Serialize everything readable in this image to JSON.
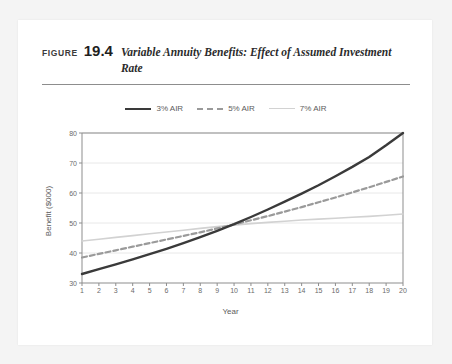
{
  "figure": {
    "label": "FIGURE",
    "number": "19.4",
    "title": "Variable Annuity Benefits: Effect of Assumed Investment Rate"
  },
  "colors": {
    "series_3": "#3a3a3a",
    "series_5": "#9a9a9a",
    "series_7": "#d2d2d2",
    "grid": "#e8e8e8",
    "axis": "#8d8d8d",
    "text": "#5c5c5c",
    "card": "#ffffff",
    "page": "#f4f4f4"
  },
  "legend": {
    "position": "top-center",
    "items": [
      {
        "label": "3% AIR",
        "style": "solid",
        "color": "#3a3a3a"
      },
      {
        "label": "5% AIR",
        "style": "dashed",
        "color": "#9a9a9a"
      },
      {
        "label": "7% AIR",
        "style": "solid",
        "color": "#d2d2d2"
      }
    ]
  },
  "chart_data": {
    "type": "line",
    "title": "Variable Annuity Benefits: Effect of Assumed Investment Rate",
    "xlabel": "Year",
    "ylabel": "Benefit ($000)",
    "xlim": [
      1,
      20
    ],
    "ylim": [
      30,
      80
    ],
    "yticks": [
      30,
      40,
      50,
      60,
      70,
      80
    ],
    "xticks": [
      1,
      2,
      3,
      4,
      5,
      6,
      7,
      8,
      9,
      10,
      11,
      12,
      13,
      14,
      15,
      16,
      17,
      18,
      19,
      20
    ],
    "grid": true,
    "x": [
      1,
      2,
      3,
      4,
      5,
      6,
      7,
      8,
      9,
      10,
      11,
      12,
      13,
      14,
      15,
      16,
      17,
      18,
      19,
      20
    ],
    "series": [
      {
        "name": "3% AIR",
        "style": "solid",
        "color": "#3a3a3a",
        "values": [
          33.0,
          34.6,
          36.2,
          37.9,
          39.6,
          41.4,
          43.3,
          45.3,
          47.4,
          49.6,
          52.0,
          54.5,
          57.1,
          59.8,
          62.6,
          65.6,
          68.7,
          72.0,
          75.9,
          80.0
        ]
      },
      {
        "name": "5% AIR",
        "style": "dashed",
        "color": "#9a9a9a",
        "values": [
          38.5,
          39.7,
          40.9,
          42.1,
          43.3,
          44.5,
          45.7,
          46.9,
          48.2,
          49.5,
          50.9,
          52.3,
          53.8,
          55.3,
          56.9,
          58.5,
          60.2,
          61.9,
          63.7,
          65.5
        ]
      },
      {
        "name": "7% AIR",
        "style": "solid",
        "color": "#d2d2d2",
        "values": [
          44.0,
          44.6,
          45.2,
          45.8,
          46.4,
          47.0,
          47.6,
          48.2,
          48.8,
          49.3,
          49.8,
          50.2,
          50.6,
          51.0,
          51.3,
          51.6,
          51.9,
          52.2,
          52.6,
          53.0
        ]
      }
    ],
    "annotations": []
  }
}
